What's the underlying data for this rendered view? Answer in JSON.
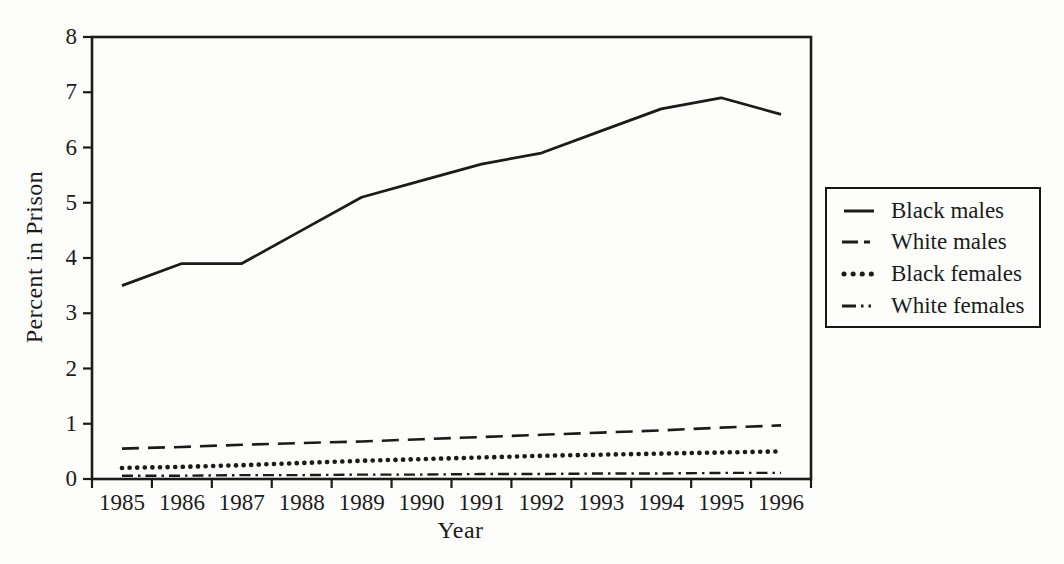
{
  "page": {
    "background": "#fdfdfc",
    "ink": "#1b1b1b"
  },
  "chart_data": {
    "type": "line",
    "title": "",
    "xlabel": "Year",
    "ylabel": "Percent in Prison",
    "x_tick_labels": [
      "1985",
      "1986",
      "1987",
      "1988",
      "1989",
      "1990",
      "1991",
      "1992",
      "1993",
      "1994",
      "1995",
      "1996"
    ],
    "y_ticks": [
      0,
      1,
      2,
      3,
      4,
      5,
      6,
      7,
      8
    ],
    "ylim": [
      0,
      8
    ],
    "grid": false,
    "legend_position": "right-outside",
    "series": [
      {
        "name": "Black males",
        "style": "solid",
        "values": [
          3.5,
          3.9,
          3.9,
          4.5,
          5.1,
          5.4,
          5.7,
          5.9,
          6.3,
          6.7,
          6.9,
          6.6
        ]
      },
      {
        "name": "White males",
        "style": "dashed",
        "values": [
          0.55,
          0.58,
          0.62,
          0.65,
          0.68,
          0.72,
          0.76,
          0.8,
          0.84,
          0.88,
          0.93,
          0.97
        ]
      },
      {
        "name": "Black females",
        "style": "dotted",
        "values": [
          0.2,
          0.22,
          0.25,
          0.29,
          0.33,
          0.36,
          0.39,
          0.42,
          0.44,
          0.46,
          0.48,
          0.5
        ]
      },
      {
        "name": "White females",
        "style": "dash-dot",
        "values": [
          0.06,
          0.06,
          0.07,
          0.07,
          0.08,
          0.08,
          0.09,
          0.09,
          0.1,
          0.1,
          0.11,
          0.11
        ]
      }
    ]
  }
}
